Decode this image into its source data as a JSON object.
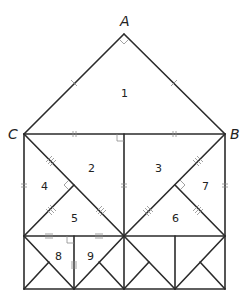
{
  "diagram": {
    "title": "",
    "vertices": {
      "A": {
        "label": "A",
        "x": 124,
        "y": 34
      },
      "B": {
        "label": "B",
        "x": 225,
        "y": 134
      },
      "C": {
        "label": "C",
        "x": 24,
        "y": 134
      }
    },
    "regions": [
      {
        "id": "1",
        "label": "1",
        "x": 124,
        "y": 96
      },
      {
        "id": "2",
        "label": "2",
        "x": 91,
        "y": 172
      },
      {
        "id": "3",
        "label": "3",
        "x": 158,
        "y": 172
      },
      {
        "id": "4",
        "label": "4",
        "x": 44,
        "y": 189
      },
      {
        "id": "5",
        "label": "5",
        "x": 74,
        "y": 219
      },
      {
        "id": "6",
        "label": "6",
        "x": 175,
        "y": 219
      },
      {
        "id": "7",
        "label": "7",
        "x": 205,
        "y": 189
      },
      {
        "id": "8",
        "label": "8",
        "x": 58,
        "y": 259
      },
      {
        "id": "9",
        "label": "9",
        "x": 90,
        "y": 259
      }
    ],
    "annotations": {
      "right_angles": [
        "A",
        "top-center",
        "left-square-center",
        "right-square-center",
        "region-8-9-junction"
      ],
      "tick_groups": [
        "single: AC, AB",
        "double: top CB halves, square sides",
        "triple: square diagonals",
        "quadruple: bottom row top edges"
      ]
    },
    "colors": {
      "line": "#2b2b2b",
      "mark": "#8a8a8a",
      "background": "#ffffff"
    }
  }
}
